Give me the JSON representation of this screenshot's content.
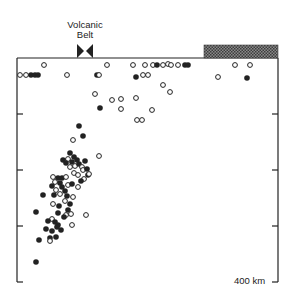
{
  "figure": {
    "volcanic_belt_label_line1": "Volcanic",
    "volcanic_belt_label_line2": "Belt",
    "depth_scale_label": "400 km",
    "colors": {
      "ink": "#222222",
      "background": "#ffffff",
      "hatch": "#6a6a6a"
    },
    "frame": {
      "left": 17,
      "right": 278,
      "top": 58,
      "bottom": 282
    },
    "ticks_y": [
      114,
      170,
      226
    ],
    "hatched_bar": {
      "x": 204,
      "y": 45,
      "width": 74,
      "height": 13
    },
    "volcanic_marker_x": 85
  },
  "legend_symbols": {
    "open_circle": "open-circle",
    "filled_circle": "filled-circle"
  },
  "points": [
    {
      "x": 44,
      "y": 65,
      "f": 0
    },
    {
      "x": 107,
      "y": 65,
      "f": 0
    },
    {
      "x": 133,
      "y": 65,
      "f": 0
    },
    {
      "x": 145,
      "y": 65,
      "f": 0
    },
    {
      "x": 153,
      "y": 65,
      "f": 0
    },
    {
      "x": 157,
      "y": 65,
      "f": 1
    },
    {
      "x": 163,
      "y": 65,
      "f": 0
    },
    {
      "x": 168,
      "y": 64,
      "f": 0
    },
    {
      "x": 171,
      "y": 65,
      "f": 0
    },
    {
      "x": 178,
      "y": 65,
      "f": 0
    },
    {
      "x": 185,
      "y": 65,
      "f": 1
    },
    {
      "x": 188,
      "y": 65,
      "f": 1
    },
    {
      "x": 235,
      "y": 65,
      "f": 0
    },
    {
      "x": 250,
      "y": 65,
      "f": 0
    },
    {
      "x": 20,
      "y": 75,
      "f": 0
    },
    {
      "x": 26,
      "y": 75,
      "f": 0
    },
    {
      "x": 31,
      "y": 75,
      "f": 1
    },
    {
      "x": 35,
      "y": 75,
      "f": 1
    },
    {
      "x": 38,
      "y": 75,
      "f": 1
    },
    {
      "x": 67,
      "y": 75,
      "f": 0
    },
    {
      "x": 97,
      "y": 75,
      "f": 1
    },
    {
      "x": 99,
      "y": 75,
      "f": 0
    },
    {
      "x": 136,
      "y": 77,
      "f": 1
    },
    {
      "x": 143,
      "y": 75,
      "f": 0
    },
    {
      "x": 148,
      "y": 75,
      "f": 0
    },
    {
      "x": 218,
      "y": 77,
      "f": 0
    },
    {
      "x": 247,
      "y": 78,
      "f": 1
    },
    {
      "x": 163,
      "y": 85,
      "f": 0
    },
    {
      "x": 170,
      "y": 92,
      "f": 0
    },
    {
      "x": 95,
      "y": 94,
      "f": 0
    },
    {
      "x": 112,
      "y": 100,
      "f": 0
    },
    {
      "x": 121,
      "y": 99,
      "f": 0
    },
    {
      "x": 136,
      "y": 98,
      "f": 0
    },
    {
      "x": 100,
      "y": 108,
      "f": 1
    },
    {
      "x": 121,
      "y": 109,
      "f": 0
    },
    {
      "x": 152,
      "y": 110,
      "f": 0
    },
    {
      "x": 142,
      "y": 120,
      "f": 0
    },
    {
      "x": 137,
      "y": 120,
      "f": 0
    },
    {
      "x": 79,
      "y": 126,
      "f": 1
    },
    {
      "x": 83,
      "y": 136,
      "f": 1
    },
    {
      "x": 73,
      "y": 140,
      "f": 0
    },
    {
      "x": 99,
      "y": 156,
      "f": 0
    },
    {
      "x": 70,
      "y": 153,
      "f": 1
    },
    {
      "x": 74,
      "y": 157,
      "f": 1
    },
    {
      "x": 68,
      "y": 159,
      "f": 0
    },
    {
      "x": 63,
      "y": 160,
      "f": 1
    },
    {
      "x": 66,
      "y": 163,
      "f": 1
    },
    {
      "x": 72,
      "y": 162,
      "f": 1
    },
    {
      "x": 77,
      "y": 160,
      "f": 1
    },
    {
      "x": 70,
      "y": 167,
      "f": 0
    },
    {
      "x": 75,
      "y": 166,
      "f": 0
    },
    {
      "x": 79,
      "y": 164,
      "f": 1
    },
    {
      "x": 85,
      "y": 161,
      "f": 1
    },
    {
      "x": 82,
      "y": 167,
      "f": 0
    },
    {
      "x": 74,
      "y": 173,
      "f": 0
    },
    {
      "x": 83,
      "y": 170,
      "f": 0
    },
    {
      "x": 87,
      "y": 169,
      "f": 1
    },
    {
      "x": 88,
      "y": 175,
      "f": 1
    },
    {
      "x": 78,
      "y": 175,
      "f": 0
    },
    {
      "x": 84,
      "y": 179,
      "f": 0
    },
    {
      "x": 89,
      "y": 174,
      "f": 0
    },
    {
      "x": 53,
      "y": 177,
      "f": 0
    },
    {
      "x": 58,
      "y": 178,
      "f": 1
    },
    {
      "x": 62,
      "y": 178,
      "f": 1
    },
    {
      "x": 66,
      "y": 177,
      "f": 0
    },
    {
      "x": 55,
      "y": 182,
      "f": 0
    },
    {
      "x": 60,
      "y": 183,
      "f": 1
    },
    {
      "x": 52,
      "y": 186,
      "f": 1
    },
    {
      "x": 56,
      "y": 190,
      "f": 0
    },
    {
      "x": 62,
      "y": 187,
      "f": 1
    },
    {
      "x": 68,
      "y": 185,
      "f": 0
    },
    {
      "x": 72,
      "y": 184,
      "f": 1
    },
    {
      "x": 78,
      "y": 187,
      "f": 0
    },
    {
      "x": 65,
      "y": 191,
      "f": 1
    },
    {
      "x": 81,
      "y": 181,
      "f": 1
    },
    {
      "x": 54,
      "y": 195,
      "f": 1
    },
    {
      "x": 60,
      "y": 194,
      "f": 0
    },
    {
      "x": 67,
      "y": 196,
      "f": 1
    },
    {
      "x": 65,
      "y": 201,
      "f": 0
    },
    {
      "x": 73,
      "y": 197,
      "f": 0
    },
    {
      "x": 70,
      "y": 204,
      "f": 1
    },
    {
      "x": 59,
      "y": 206,
      "f": 1
    },
    {
      "x": 43,
      "y": 195,
      "f": 1
    },
    {
      "x": 53,
      "y": 204,
      "f": 0
    },
    {
      "x": 68,
      "y": 210,
      "f": 1
    },
    {
      "x": 71,
      "y": 214,
      "f": 0
    },
    {
      "x": 86,
      "y": 215,
      "f": 0
    },
    {
      "x": 66,
      "y": 215,
      "f": 0
    },
    {
      "x": 36,
      "y": 212,
      "f": 1
    },
    {
      "x": 52,
      "y": 219,
      "f": 0
    },
    {
      "x": 58,
      "y": 213,
      "f": 1
    },
    {
      "x": 64,
      "y": 217,
      "f": 1
    },
    {
      "x": 48,
      "y": 221,
      "f": 1
    },
    {
      "x": 55,
      "y": 222,
      "f": 1
    },
    {
      "x": 58,
      "y": 225,
      "f": 1
    },
    {
      "x": 61,
      "y": 230,
      "f": 1
    },
    {
      "x": 72,
      "y": 225,
      "f": 0
    },
    {
      "x": 46,
      "y": 229,
      "f": 1
    },
    {
      "x": 52,
      "y": 231,
      "f": 1
    },
    {
      "x": 57,
      "y": 227,
      "f": 1
    },
    {
      "x": 39,
      "y": 240,
      "f": 1
    },
    {
      "x": 50,
      "y": 238,
      "f": 1
    },
    {
      "x": 50,
      "y": 241,
      "f": 0
    },
    {
      "x": 56,
      "y": 237,
      "f": 1
    },
    {
      "x": 36,
      "y": 262,
      "f": 1
    }
  ]
}
